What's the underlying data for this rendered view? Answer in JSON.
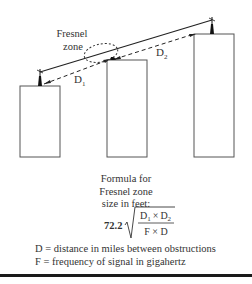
{
  "diagram": {
    "zone_label_line1": "Fresnel",
    "zone_label_line2": "zone",
    "d1_label": "D",
    "d1_sub": "1",
    "d2_label": "D",
    "d2_sub": "2",
    "buildings": [
      {
        "name": "left",
        "x": 20,
        "y": 86,
        "w": 40,
        "h": 71
      },
      {
        "name": "middle",
        "x": 107,
        "y": 60,
        "w": 40,
        "h": 97
      },
      {
        "name": "right",
        "x": 194,
        "y": 34,
        "w": 40,
        "h": 123
      }
    ]
  },
  "formula": {
    "caption_line1": "Formula for",
    "caption_line2": "Fresnel zone",
    "caption_line3": "size in feet:",
    "coefficient": "72.2",
    "numerator_a": "D",
    "numerator_a_sub": "1",
    "times_symbol": "×",
    "numerator_b": "D",
    "numerator_b_sub": "2",
    "denominator": "F × D"
  },
  "legend": {
    "line1": "D = distance in miles between obstructions",
    "line2": "F = frequency of signal in gigahertz"
  }
}
